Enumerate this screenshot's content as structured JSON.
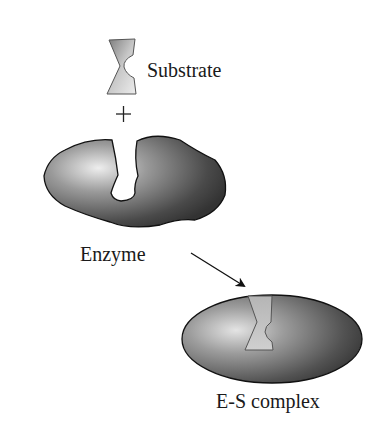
{
  "diagram": {
    "labels": {
      "substrate": "Substrate",
      "plus": "+",
      "enzyme": "Enzyme",
      "complex": "E-S complex"
    },
    "nodes": [
      {
        "id": "substrate",
        "label": "Substrate",
        "shape": "hourglass-wedge"
      },
      {
        "id": "enzyme",
        "label": "Enzyme",
        "shape": "blob-with-notch"
      },
      {
        "id": "complex",
        "label": "E-S complex",
        "shape": "ellipse-with-bound-substrate"
      }
    ],
    "edges": [
      {
        "from": "enzyme",
        "to": "complex",
        "type": "arrow"
      }
    ],
    "colors": {
      "enzyme_dark": "#3c3c3c",
      "enzyme_light": "#e8e8e8",
      "substrate_light": "#e6e6e6",
      "substrate_dark": "#8a8a8a",
      "outline": "#111111"
    }
  }
}
